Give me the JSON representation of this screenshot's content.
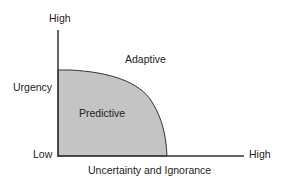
{
  "diagram": {
    "y_axis": {
      "label": "Urgency",
      "high": "High",
      "low": "Low"
    },
    "x_axis": {
      "label": "Uncertainty and Ignorance",
      "high": "High"
    },
    "regions": {
      "inner": "Predictive",
      "outer": "Adaptive"
    },
    "colors": {
      "fill": "#c4c4c4",
      "line": "#333333"
    }
  }
}
